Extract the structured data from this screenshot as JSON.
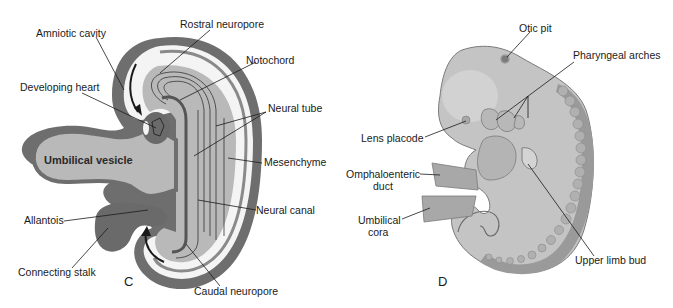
{
  "figure": {
    "panels": [
      {
        "id": "C",
        "label": "C",
        "description": "Sagittal section of folding embryo",
        "labels": {
          "amniotic_cavity": "Amniotic cavity",
          "rostral_neuropore": "Rostral neuropore",
          "notochord": "Notochord",
          "developing_heart": "Developing heart",
          "neural_tube": "Neural tube",
          "umbilical_vesicle": "Umbilical vesicle",
          "mesenchyme": "Mesenchyme",
          "allantois": "Allantois",
          "neural_canal": "Neural canal",
          "connecting_stalk": "Connecting stalk",
          "caudal_neuropore": "Caudal neuropore"
        }
      },
      {
        "id": "D",
        "label": "D",
        "description": "Lateral view of embryo",
        "labels": {
          "otic_pit": "Otic pit",
          "pharyngeal_arches": "Pharyngeal arches",
          "lens_placode": "Lens placode",
          "omphaloenteric_duct_line1": "Omphaloenteric",
          "omphaloenteric_duct_line2": "duct",
          "umbilical_cord_line1": "Umbilical",
          "umbilical_cord_line2": "cora",
          "upper_limb_bud": "Upper limb bud"
        }
      }
    ],
    "colors": {
      "background": "#ffffff",
      "outer_wall": "#6e6e6e",
      "amnion_space": "#f4f4f4",
      "embryo_fill": "#b9b9b9",
      "inner_fill": "#c8c8c8",
      "dark_tissue": "#6a6a6a",
      "ink": "#1a1a1a",
      "embryo_d_fill": "#c4c4c4",
      "somite": "#9a9a9a"
    }
  }
}
